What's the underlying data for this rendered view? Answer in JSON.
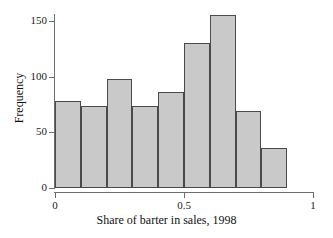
{
  "chart_data": {
    "type": "bar",
    "title": "",
    "subtitle": "",
    "xlabel": "Share of barter in sales, 1998",
    "ylabel": "Frequency",
    "grid": false,
    "legend": null,
    "xlim": [
      0,
      1
    ],
    "ylim": [
      0,
      160
    ],
    "xticks": [
      0,
      0.5,
      1
    ],
    "xtick_labels": [
      "0",
      "0.5",
      "1"
    ],
    "yticks": [
      0,
      50,
      100,
      150
    ],
    "ytick_labels": [
      "0",
      "50",
      "100",
      "150"
    ],
    "bin_width": 0.1,
    "bin_edges": [
      0,
      0.1,
      0.2,
      0.3,
      0.4,
      0.5,
      0.6,
      0.7,
      0.8,
      0.9
    ],
    "categories": [
      "0.0-0.1",
      "0.1-0.2",
      "0.2-0.3",
      "0.3-0.4",
      "0.4-0.5",
      "0.5-0.6",
      "0.6-0.7",
      "0.7-0.8",
      "0.8-0.9"
    ],
    "values": [
      78,
      74,
      98,
      74,
      86,
      130,
      155,
      69,
      36
    ],
    "bar_fill_color": "#c9c9c9",
    "bar_edge_color": "#4a4a4a",
    "axis_color": "#6e6e6e"
  }
}
